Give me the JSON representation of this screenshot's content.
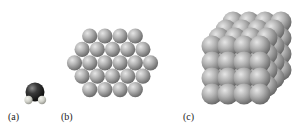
{
  "figure": {
    "panels": [
      {
        "id": "a",
        "label": "(a)",
        "description": "single molecule (dark central sphere with two small light spheres)"
      },
      {
        "id": "b",
        "label": "(b)",
        "description": "hexagonal close-packed single layer of spheres",
        "rows": [
          4,
          5,
          6,
          5,
          4
        ]
      },
      {
        "id": "c",
        "label": "(c)",
        "description": "three-dimensional cubic cluster of close-packed spheres"
      }
    ]
  },
  "colors": {
    "sphere_light": "#d9d9d9",
    "sphere_mid": "#a6a6a6",
    "sphere_dark": "#6e6e6e",
    "molecule_core_light": "#7a7a7a",
    "molecule_core_dark": "#1a1a1a",
    "label": "#222222"
  }
}
